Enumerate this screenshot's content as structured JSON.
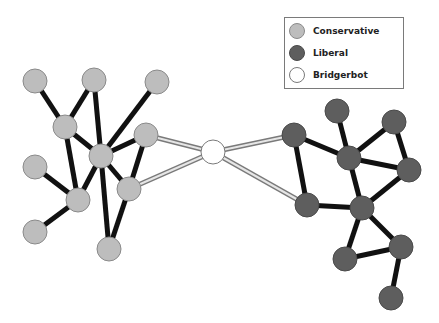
{
  "legend": {
    "items": [
      {
        "label": "Conservative",
        "color": "#bdbdbd",
        "stroke": "#8a8a8a"
      },
      {
        "label": "Liberal",
        "color": "#5e5e5e",
        "stroke": "#4a4a4a"
      },
      {
        "label": "Bridgerbot",
        "color": "#ffffff",
        "stroke": "#7a7a7a"
      }
    ]
  },
  "style": {
    "edge_color": "#111111",
    "bridge_edge_outer": "#7a7a7a",
    "bridge_edge_inner": "#e6e6e6",
    "node_radius": 12
  },
  "nodes": [
    {
      "id": "A",
      "group": "Conservative",
      "x": 35,
      "y": 81
    },
    {
      "id": "B",
      "group": "Conservative",
      "x": 94,
      "y": 80
    },
    {
      "id": "C",
      "group": "Conservative",
      "x": 157,
      "y": 82
    },
    {
      "id": "D",
      "group": "Conservative",
      "x": 65,
      "y": 127
    },
    {
      "id": "E",
      "group": "Conservative",
      "x": 101,
      "y": 156
    },
    {
      "id": "F",
      "group": "Conservative",
      "x": 146,
      "y": 135
    },
    {
      "id": "G",
      "group": "Conservative",
      "x": 35,
      "y": 167
    },
    {
      "id": "H",
      "group": "Conservative",
      "x": 78,
      "y": 200
    },
    {
      "id": "I",
      "group": "Conservative",
      "x": 129,
      "y": 189
    },
    {
      "id": "J",
      "group": "Conservative",
      "x": 35,
      "y": 232
    },
    {
      "id": "K",
      "group": "Conservative",
      "x": 109,
      "y": 249
    },
    {
      "id": "BR",
      "group": "Bridgerbot",
      "x": 213,
      "y": 152
    },
    {
      "id": "L1",
      "group": "Liberal",
      "x": 294,
      "y": 135
    },
    {
      "id": "L2",
      "group": "Liberal",
      "x": 307,
      "y": 205
    },
    {
      "id": "L3",
      "group": "Liberal",
      "x": 337,
      "y": 111
    },
    {
      "id": "L4",
      "group": "Liberal",
      "x": 349,
      "y": 158
    },
    {
      "id": "L5",
      "group": "Liberal",
      "x": 394,
      "y": 122
    },
    {
      "id": "L6",
      "group": "Liberal",
      "x": 409,
      "y": 170
    },
    {
      "id": "L7",
      "group": "Liberal",
      "x": 362,
      "y": 208
    },
    {
      "id": "L8",
      "group": "Liberal",
      "x": 345,
      "y": 259
    },
    {
      "id": "L9",
      "group": "Liberal",
      "x": 401,
      "y": 247
    },
    {
      "id": "L10",
      "group": "Liberal",
      "x": 391,
      "y": 298
    }
  ],
  "edges": [
    {
      "source": "A",
      "target": "D",
      "type": "normal"
    },
    {
      "source": "B",
      "target": "D",
      "type": "normal"
    },
    {
      "source": "B",
      "target": "E",
      "type": "normal"
    },
    {
      "source": "C",
      "target": "E",
      "type": "normal"
    },
    {
      "source": "D",
      "target": "E",
      "type": "normal"
    },
    {
      "source": "D",
      "target": "H",
      "type": "normal"
    },
    {
      "source": "E",
      "target": "F",
      "type": "normal"
    },
    {
      "source": "E",
      "target": "H",
      "type": "normal"
    },
    {
      "source": "E",
      "target": "I",
      "type": "normal"
    },
    {
      "source": "E",
      "target": "K",
      "type": "normal"
    },
    {
      "source": "F",
      "target": "I",
      "type": "normal"
    },
    {
      "source": "G",
      "target": "H",
      "type": "normal"
    },
    {
      "source": "H",
      "target": "J",
      "type": "normal"
    },
    {
      "source": "I",
      "target": "K",
      "type": "normal"
    },
    {
      "source": "F",
      "target": "BR",
      "type": "bridge"
    },
    {
      "source": "I",
      "target": "BR",
      "type": "bridge"
    },
    {
      "source": "BR",
      "target": "L1",
      "type": "bridge"
    },
    {
      "source": "BR",
      "target": "L2",
      "type": "bridge"
    },
    {
      "source": "L1",
      "target": "L4",
      "type": "normal"
    },
    {
      "source": "L1",
      "target": "L2",
      "type": "normal"
    },
    {
      "source": "L3",
      "target": "L4",
      "type": "normal"
    },
    {
      "source": "L5",
      "target": "L4",
      "type": "normal"
    },
    {
      "source": "L5",
      "target": "L6",
      "type": "normal"
    },
    {
      "source": "L4",
      "target": "L6",
      "type": "normal"
    },
    {
      "source": "L4",
      "target": "L7",
      "type": "normal"
    },
    {
      "source": "L2",
      "target": "L7",
      "type": "normal"
    },
    {
      "source": "L7",
      "target": "L6",
      "type": "normal"
    },
    {
      "source": "L7",
      "target": "L8",
      "type": "normal"
    },
    {
      "source": "L7",
      "target": "L9",
      "type": "normal"
    },
    {
      "source": "L8",
      "target": "L9",
      "type": "normal"
    },
    {
      "source": "L9",
      "target": "L10",
      "type": "normal"
    }
  ]
}
